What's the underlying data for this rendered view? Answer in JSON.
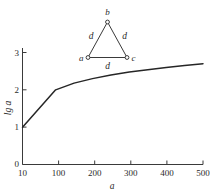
{
  "chart_data": {
    "type": "line",
    "title": "",
    "xlabel": "a",
    "ylabel": "lg a",
    "xlim": [
      10,
      500
    ],
    "ylim": [
      0,
      3
    ],
    "grid": false,
    "legend": null,
    "xticks": [
      {
        "value": 10,
        "label": "10"
      },
      {
        "value": 100,
        "label": "100"
      },
      {
        "value": 200,
        "label": "200"
      },
      {
        "value": 300,
        "label": "300"
      },
      {
        "value": 400,
        "label": "400"
      },
      {
        "value": 500,
        "label": "500"
      }
    ],
    "yticks": [
      {
        "value": 0,
        "label": "0"
      },
      {
        "value": 1,
        "label": "1"
      },
      {
        "value": 2,
        "label": "2"
      },
      {
        "value": 3,
        "label": "3"
      }
    ],
    "series": [
      {
        "name": "lg a",
        "x": [
          10,
          100,
          150,
          200,
          250,
          300,
          350,
          400,
          450,
          500
        ],
        "values": [
          1.0,
          2.0,
          2.18,
          2.3,
          2.4,
          2.48,
          2.54,
          2.6,
          2.65,
          2.7
        ]
      }
    ]
  },
  "inset_diagram": {
    "type": "triangle-graph",
    "nodes": [
      {
        "id": "a",
        "label": "a",
        "position": "bottom-left"
      },
      {
        "id": "b",
        "label": "b",
        "position": "top"
      },
      {
        "id": "c",
        "label": "c",
        "position": "bottom-right"
      }
    ],
    "edges": [
      {
        "from": "a",
        "to": "b",
        "label": "d"
      },
      {
        "from": "b",
        "to": "c",
        "label": "d"
      },
      {
        "from": "a",
        "to": "c",
        "label": "d"
      }
    ]
  },
  "colors": {
    "background": "#ffffff",
    "axis": "#3a3a3a",
    "curve": "#262626",
    "text": "#2b2b2b"
  }
}
